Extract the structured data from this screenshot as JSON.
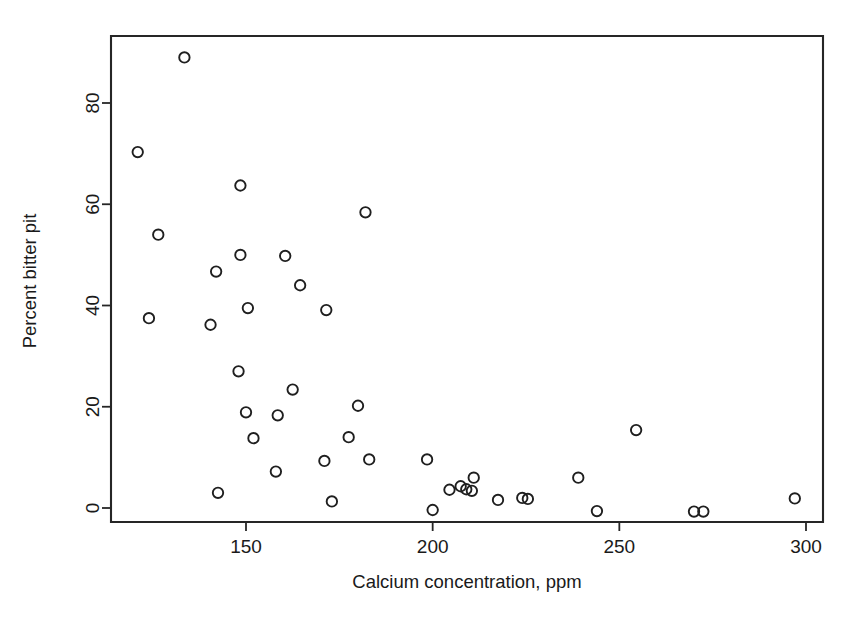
{
  "chart_data": {
    "type": "scatter",
    "title": "",
    "xlabel": "Calcium concentration, ppm",
    "ylabel": "Percent bitter pit",
    "xlim": [
      118,
      308
    ],
    "ylim": [
      -3.5,
      93
    ],
    "xticks": [
      150,
      200,
      250,
      300
    ],
    "yticks": [
      0,
      20,
      40,
      60,
      80
    ],
    "xtick_labels": [
      "150",
      "200",
      "250",
      "300"
    ],
    "ytick_labels": [
      "0",
      "20",
      "40",
      "60",
      "80"
    ],
    "grid": false,
    "legend": null,
    "marker": "open-circle",
    "marker_color": "#1f1f1f",
    "series": [
      {
        "name": "Bitter pit vs calcium",
        "points": [
          [
            133.5,
            89.0
          ],
          [
            121.0,
            70.3
          ],
          [
            148.5,
            63.7
          ],
          [
            182.0,
            58.4
          ],
          [
            126.5,
            54.0
          ],
          [
            148.5,
            50.0
          ],
          [
            160.5,
            49.8
          ],
          [
            142.0,
            46.7
          ],
          [
            164.5,
            44.0
          ],
          [
            150.5,
            39.5
          ],
          [
            171.5,
            39.1
          ],
          [
            124.0,
            37.5
          ],
          [
            140.5,
            36.2
          ],
          [
            148.0,
            27.0
          ],
          [
            162.5,
            23.4
          ],
          [
            180.0,
            20.2
          ],
          [
            150.0,
            18.9
          ],
          [
            158.5,
            18.3
          ],
          [
            152.0,
            13.8
          ],
          [
            177.5,
            14.0
          ],
          [
            171.0,
            9.3
          ],
          [
            183.0,
            9.6
          ],
          [
            198.5,
            9.6
          ],
          [
            158.0,
            7.2
          ],
          [
            239.0,
            6.0
          ],
          [
            211.0,
            6.0
          ],
          [
            254.5,
            15.4
          ],
          [
            204.5,
            3.6
          ],
          [
            207.5,
            4.3
          ],
          [
            209.0,
            3.7
          ],
          [
            210.5,
            3.4
          ],
          [
            224.0,
            2.0
          ],
          [
            225.5,
            1.8
          ],
          [
            142.5,
            3.0
          ],
          [
            173.0,
            1.3
          ],
          [
            217.5,
            1.6
          ],
          [
            297.0,
            1.9
          ],
          [
            200.0,
            -0.4
          ],
          [
            244.0,
            -0.6
          ],
          [
            270.0,
            -0.7
          ],
          [
            272.5,
            -0.7
          ]
        ]
      }
    ]
  },
  "axes": {
    "x_title": "Calcium concentration, ppm",
    "y_title": "Percent bitter pit"
  }
}
